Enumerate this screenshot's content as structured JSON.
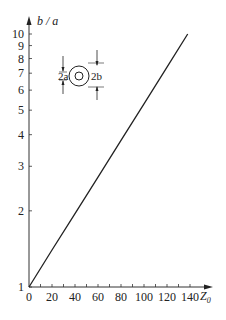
{
  "chart_data": {
    "type": "line",
    "title": "",
    "xlabel": "Z0",
    "ylabel": "b / a",
    "xscale": "linear",
    "yscale": "log",
    "xlim": [
      0,
      145
    ],
    "ylim": [
      1,
      10.5
    ],
    "x_ticks": [
      0,
      20,
      40,
      60,
      80,
      100,
      120,
      140
    ],
    "x_tick_labels": [
      "0",
      "20",
      "40",
      "60",
      "80",
      "100",
      "120",
      "140"
    ],
    "y_ticks": [
      1,
      2,
      3,
      4,
      5,
      6,
      7,
      8,
      9,
      10
    ],
    "y_tick_labels": [
      "1",
      "2",
      "3",
      "4",
      "5",
      "6",
      "7",
      "8",
      "9",
      "10"
    ],
    "grid": false,
    "legend": null,
    "series": [
      {
        "name": "b/a vs Z0",
        "x": [
          0,
          20,
          40,
          60,
          80,
          100,
          120,
          138
        ],
        "y": [
          1.0,
          1.4,
          1.95,
          2.72,
          3.8,
          5.3,
          7.4,
          10.0
        ]
      }
    ],
    "annotations": [
      {
        "type": "inset-diagram",
        "description": "coaxial cross-section: inner conductor diameter 2a, outer conductor diameter 2b",
        "labels": [
          "2a",
          "2b"
        ]
      }
    ]
  },
  "axes": {
    "y_label": "b / a",
    "x_label_main": "Z",
    "x_label_sub": "0"
  },
  "inset": {
    "inner_label": "2a",
    "outer_label": "2b"
  }
}
